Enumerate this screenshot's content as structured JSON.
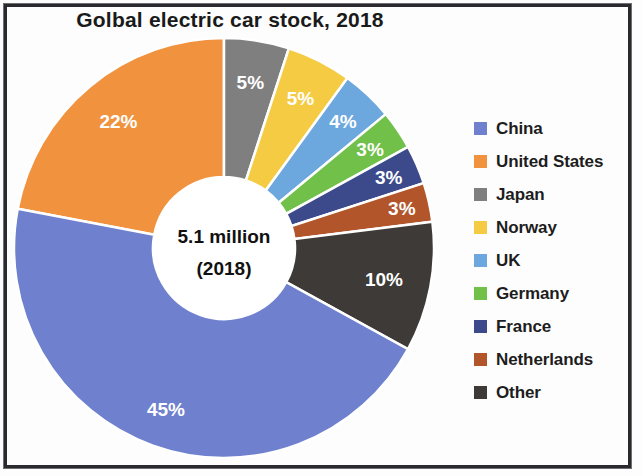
{
  "chart_data": {
    "type": "pie",
    "variant": "donut",
    "title": "Golbal electric car stock, 2018",
    "center_label_line1": "5.1 million",
    "center_label_line2": "(2018)",
    "unit": "percent",
    "total_label": "5.1 million",
    "year": "2018",
    "categories": [
      "China",
      "United States",
      "Japan",
      "Norway",
      "UK",
      "Germany",
      "France",
      "Netherlands",
      "Other"
    ],
    "values": [
      45,
      22,
      5,
      5,
      4,
      3,
      3,
      3,
      10
    ],
    "value_labels": [
      "45%",
      "22%",
      "5%",
      "5%",
      "4%",
      "3%",
      "3%",
      "3%",
      "10%"
    ],
    "colors": [
      "#6E80CE",
      "#F0923E",
      "#7F7F7F",
      "#F5CB44",
      "#6CA7DD",
      "#71C martin",
      "#3C4A8C",
      "#B2552A",
      "#3D3A38"
    ],
    "legend_position": "right",
    "grid": false,
    "xlabel": "",
    "ylabel": ""
  },
  "chart": {
    "title": "Golbal electric car stock, 2018",
    "center": {
      "line1": "5.1 million",
      "line2": "(2018)"
    },
    "slices": [
      {
        "name": "United States",
        "label": "22%",
        "value": 22,
        "color": "#F0923E",
        "start": -79.2,
        "sweep": 79.2,
        "label_r": 0.68
      },
      {
        "name": "Japan",
        "label": "5%",
        "value": 5,
        "color": "#7F7F7F",
        "start": 0.0,
        "sweep": 18.0,
        "label_r": 0.7
      },
      {
        "name": "Norway",
        "label": "5%",
        "value": 5,
        "color": "#F5CB44",
        "start": 18.0,
        "sweep": 18.0,
        "label_r": 0.7
      },
      {
        "name": "UK",
        "label": "4%",
        "value": 4,
        "color": "#6CA7DD",
        "start": 36.0,
        "sweep": 14.4,
        "label_r": 0.74
      },
      {
        "name": "Germany",
        "label": "3%",
        "value": 3,
        "color": "#70C04A",
        "start": 50.4,
        "sweep": 10.8,
        "label_r": 0.76
      },
      {
        "name": "France",
        "label": "3%",
        "value": 3,
        "color": "#3C4A8C",
        "start": 61.2,
        "sweep": 10.8,
        "label_r": 0.78
      },
      {
        "name": "Netherlands",
        "label": "3%",
        "value": 3,
        "color": "#B2552A",
        "start": 72.0,
        "sweep": 10.8,
        "label_r": 0.8
      },
      {
        "name": "Other",
        "label": "10%",
        "value": 10,
        "color": "#3D3A38",
        "start": 82.8,
        "sweep": 36.0,
        "label_r": 0.66
      },
      {
        "name": "China",
        "label": "45%",
        "value": 45,
        "color": "#6E80CE",
        "start": 118.8,
        "sweep": 162.0,
        "label_r": 0.72
      }
    ]
  },
  "legend": {
    "items": [
      {
        "label": "China",
        "color": "#6E80CE"
      },
      {
        "label": "United States",
        "color": "#F0923E"
      },
      {
        "label": "Japan",
        "color": "#7F7F7F"
      },
      {
        "label": "Norway",
        "color": "#F5CB44"
      },
      {
        "label": "UK",
        "color": "#6CA7DD"
      },
      {
        "label": "Germany",
        "color": "#70C04A"
      },
      {
        "label": "France",
        "color": "#3C4A8C"
      },
      {
        "label": "Netherlands",
        "color": "#B2552A"
      },
      {
        "label": "Other",
        "color": "#3D3A38"
      }
    ]
  }
}
